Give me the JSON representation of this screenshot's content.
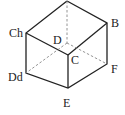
{
  "diagram": {
    "type": "cube",
    "labels": {
      "ch": "Ch",
      "b": "B",
      "d": "D",
      "c": "C",
      "f": "F",
      "dd": "Dd",
      "e": "E"
    },
    "colors": {
      "stroke": "#222222",
      "dashed": "#888888"
    }
  }
}
